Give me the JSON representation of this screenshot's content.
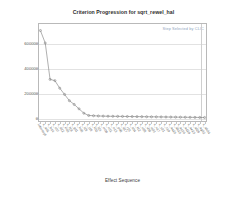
{
  "chart_data": {
    "type": "line",
    "title": "Criterion Progression for sqrt_rewel_hal",
    "xlabel": "Effect Sequence",
    "ylabel": "Multiverse (Cp)",
    "annotation": "Step Selected by CLIC",
    "grid": true,
    "legend_position": "none",
    "ylim": [
      -30000,
      760000
    ],
    "yticks": [
      0,
      200000,
      400000,
      600000
    ],
    "ytick_labels": [
      "0",
      "200000",
      "400000",
      "600000"
    ],
    "selected_step_index": 33,
    "marker": "circle",
    "line_color": "#7b7b7b",
    "annotation_color": "#8fa4bd",
    "categories": [
      "Intercept",
      "x_a01",
      "x_b14",
      "x_c07",
      "x_d22",
      "x_e03",
      "x_f18",
      "x_g11",
      "x_h05",
      "x_i29",
      "x_j16",
      "x_k02",
      "x_l24",
      "x_m08",
      "x_n31",
      "x_o13",
      "x_p06",
      "x_q27",
      "x_r19",
      "x_s04",
      "x_t12",
      "x_u26",
      "x_v09",
      "x_w33",
      "x_x17",
      "x_y21",
      "x_z10",
      "x_aa25",
      "x_ab15",
      "x_ac30",
      "x_ad20",
      "x_ae23",
      "x_af28",
      "x_ag32",
      "x_ah34"
    ],
    "values": [
      700000,
      600000,
      310000,
      300000,
      240000,
      190000,
      140000,
      110000,
      75000,
      40000,
      22000,
      20000,
      18000,
      17000,
      16000,
      15500,
      15000,
      14500,
      14000,
      13500,
      13000,
      12500,
      12000,
      11500,
      11000,
      10500,
      10000,
      9500,
      9000,
      8500,
      8000,
      7500,
      7000,
      6500,
      6000
    ]
  }
}
